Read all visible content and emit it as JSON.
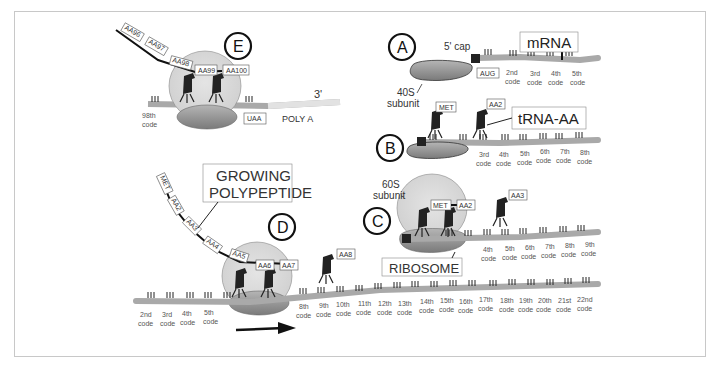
{
  "colors": {
    "mrna": "#a9a9a9",
    "poly_a": "#e2e2e2",
    "ribosome_large": "#d9d9d9",
    "ribosome_small": "#8c8c8c",
    "trna": "#222222",
    "frame": "#c8c8c8"
  },
  "steps": {
    "A": {
      "label": "A",
      "cap_label": "5' cap",
      "mrna_label": "mRNA",
      "start_codon": "AUG",
      "subunit_label_1": "40S",
      "subunit_label_2": "subunit",
      "codes": [
        "2nd",
        "3rd",
        "4th",
        "5th"
      ]
    },
    "B": {
      "label": "B",
      "trna_label": "tRNA-AA",
      "amino_acids": [
        "MET",
        "AA2"
      ],
      "codes": [
        "3rd",
        "4th",
        "5th",
        "6th",
        "7th",
        "8th"
      ]
    },
    "C": {
      "label": "C",
      "subunit_label_1": "60S",
      "subunit_label_2": "subunit",
      "ribosome_label": "RIBOSOME",
      "amino_acids": [
        "MET",
        "AA2",
        "AA3"
      ],
      "codes": [
        "4th",
        "5th",
        "6th",
        "7th",
        "8th",
        "9th"
      ]
    },
    "D": {
      "label": "D",
      "polypeptide_label_1": "GROWING",
      "polypeptide_label_2": "POLYPEPTIDE",
      "amino_acids": [
        "MET",
        "AA2",
        "AA3",
        "AA4",
        "AA5",
        "AA6",
        "AA7",
        "AA8"
      ],
      "codes_left": [
        "2nd",
        "3rd",
        "4th",
        "5th"
      ],
      "codes_right": [
        "8th",
        "9th",
        "10th",
        "11th",
        "12th",
        "13th",
        "14th",
        "15th",
        "16th",
        "17th",
        "18th",
        "19th",
        "20th",
        "21st",
        "22nd"
      ],
      "direction": "right-arrow"
    },
    "E": {
      "label": "E",
      "three_prime": "3'",
      "poly_a": "POLY A",
      "stop_codon": "UAA",
      "code_98": "98th",
      "amino_acids": [
        "AA96",
        "AA97",
        "AA98",
        "AA99",
        "AA100"
      ]
    },
    "code_word": "code"
  }
}
